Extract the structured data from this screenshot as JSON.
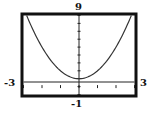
{
  "chart_data": {
    "type": "line",
    "title": "",
    "xlabel": "",
    "ylabel": "",
    "xlim": [
      -3,
      3
    ],
    "ylim": [
      -1,
      9
    ],
    "xscale_ticks": 1,
    "yscale_ticks": 1,
    "grid": false,
    "legend": null,
    "series": [
      {
        "name": "parabola",
        "function": "y = x^2 + 1",
        "x": [
          -2.83,
          -2.5,
          -2,
          -1.5,
          -1,
          -0.5,
          0,
          0.5,
          1,
          1.5,
          2,
          2.5,
          2.83
        ],
        "y": [
          9,
          7.25,
          5,
          3.25,
          2,
          1.25,
          1,
          1.25,
          2,
          3.25,
          5,
          7.25,
          9
        ]
      }
    ],
    "window_labels": {
      "xmin": "-3",
      "xmax": "3",
      "ymin": "-1",
      "ymax": "9"
    }
  },
  "colors": {
    "frame": "#111111",
    "curve": "#333333",
    "axes": "#222222"
  }
}
